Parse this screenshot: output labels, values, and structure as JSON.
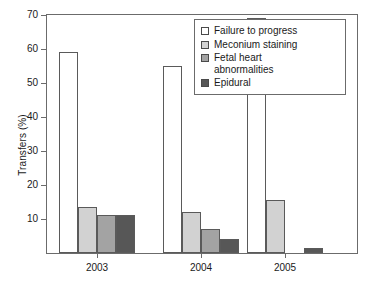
{
  "chart_data": {
    "type": "bar",
    "title": "",
    "xlabel": "",
    "ylabel": "Transfers (%)",
    "categories": [
      "2003",
      "2004",
      "2005"
    ],
    "ylim": [
      0,
      70
    ],
    "yticks": [
      0,
      10,
      20,
      30,
      40,
      50,
      60,
      70
    ],
    "ytick_labels": [
      "",
      "10",
      "20",
      "30",
      "40",
      "50",
      "60",
      "70"
    ],
    "grid": false,
    "legend_position": "top-right",
    "series": [
      {
        "name": "Failure to progress",
        "color": "#ffffff",
        "values": [
          59,
          55,
          69
        ]
      },
      {
        "name": "Meconium staining",
        "color": "#d2d2d2",
        "values": [
          13.5,
          12,
          15.5
        ]
      },
      {
        "name": "Fetal heart\nabnormalities",
        "color": "#a3a3a3",
        "values": [
          11.3,
          7,
          0
        ]
      },
      {
        "name": "Epidural",
        "color": "#575757",
        "values": [
          11.3,
          4,
          1.5
        ]
      }
    ]
  },
  "legend": {
    "items": [
      "Failure to progress",
      "Meconium staining",
      "Fetal heart\nabnormalities",
      "Epidural"
    ]
  },
  "axes": {
    "y_title": "Transfers (%)",
    "y_tick_labels": [
      "10",
      "20",
      "30",
      "40",
      "50",
      "60",
      "70"
    ],
    "x_tick_labels": [
      "2003",
      "2004",
      "2005"
    ]
  },
  "colors": {
    "frame": "#6b6b6b",
    "bar_outline": "#5a5a5a",
    "text": "#1a1a1a",
    "series_1": "#ffffff",
    "series_2": "#d2d2d2",
    "series_3": "#a3a3a3",
    "series_4": "#575757"
  }
}
